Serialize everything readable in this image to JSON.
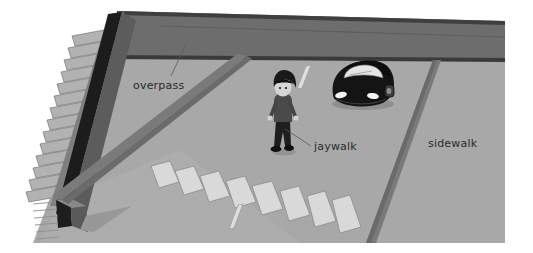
{
  "illustration": {
    "title": "Street scene with overpass, jaywalking pedestrian, crosswalk and sidewalk",
    "canvas": {
      "width": 533,
      "height": 253
    },
    "background_color": "#ffffff"
  },
  "palette": {
    "page_background": "#ffffff",
    "road_surface": "#a8a8a8",
    "road_surface_light": "#b0b0b0",
    "overpass_deck": "#6d6d6d",
    "overpass_edge": "#3a3a3a",
    "curb_line": "#7d7d7d",
    "curb_line_dark": "#6a6a6a",
    "crosswalk_stripe": "#d8d8d8",
    "crosswalk_stripe_outline": "#8e8e8e",
    "lane_dash": "#dcdcdc",
    "stair_tread": "#9a9a9a",
    "stair_tread_light": "#b4b4b4",
    "stair_side_wall": "#5c5c5c",
    "stair_rail_dark": "#1c1c1c",
    "car_body": "#141414",
    "car_windshield": "#e2e2e2",
    "car_headlight": "#f2f2f2",
    "person_hair": "#1a1a1a",
    "person_face": "#d6d6d6",
    "person_jacket": "#4a4a4a",
    "person_pants": "#1e1e1e",
    "person_shoes": "#111111",
    "label_text": "#2b2b2b",
    "leader_line": "#55555555"
  },
  "labels": [
    {
      "id": "overpass",
      "text": "overpass",
      "x": 133,
      "y": 89,
      "anchor": "start",
      "has_leader": true,
      "leader": {
        "x1": 171,
        "y1": 76,
        "x2": 186,
        "y2": 44
      }
    },
    {
      "id": "jaywalk",
      "text": "jaywalk",
      "x": 314,
      "y": 150,
      "anchor": "start",
      "has_leader": true,
      "leader": {
        "x1": 311,
        "y1": 146,
        "x2": 285,
        "y2": 129
      }
    },
    {
      "id": "sidewalk",
      "text": "sidewalk",
      "x": 428,
      "y": 147,
      "anchor": "start",
      "has_leader": false,
      "leader": null
    }
  ],
  "scene_objects": {
    "overpass": {
      "name": "overpass-deck",
      "description": "Dark elevated deck band spanning the top of the image"
    },
    "staircase": {
      "name": "staircase",
      "description": "Flight of stairs descending from the overpass on the left side",
      "step_count": 14
    },
    "car": {
      "name": "car",
      "description": "Dark car facing the viewer on the road near the overpass",
      "headlight_count": 2
    },
    "pedestrian": {
      "name": "pedestrian",
      "description": "Person with dark hair walking across the road away from the crosswalk"
    },
    "crosswalk": {
      "name": "crosswalk",
      "description": "Row of light painted stripes crossing the road in perspective",
      "stripe_count": 8
    },
    "lane_dashes": {
      "name": "lane-dashes",
      "description": "Short light lane divider dashes painted on the road",
      "count": 2
    },
    "sidewalk_right": {
      "name": "sidewalk-right",
      "description": "Paved sidewalk area on the right bounded by a curb line"
    }
  }
}
